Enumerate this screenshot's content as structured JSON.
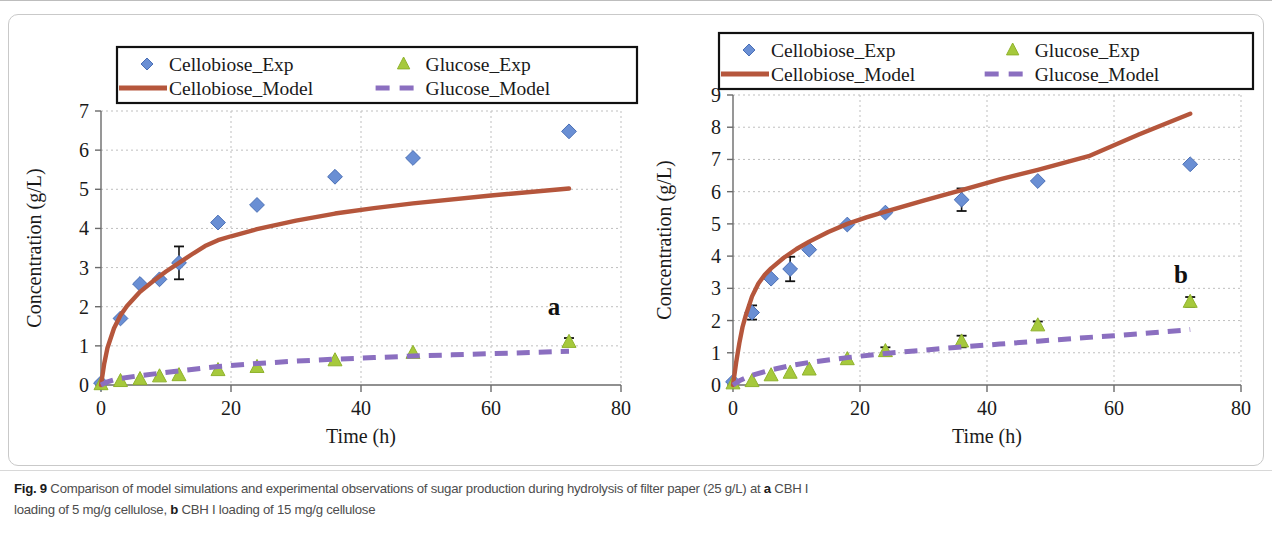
{
  "figure": {
    "number": "Fig. 9",
    "caption_line1_pre": "Comparison of model simulations and experimental observations of sugar production during hydrolysis of filter paper (25 g/L) at ",
    "caption_bold_a": "a",
    "caption_line1_post": " CBH I",
    "caption_line2_pre": "loading of 5 mg/g cellulose, ",
    "caption_bold_b": "b",
    "caption_line2_post": " CBH I loading of 15 mg/g cellulose"
  },
  "colors": {
    "cellobiose_exp": "#6a8fd4",
    "cellobiose_exp_edge": "#4a6fb5",
    "glucose_exp": "#a6c93c",
    "glucose_exp_edge": "#8fb22c",
    "cellobiose_model": "#b5563c",
    "glucose_model": "#8b6fc0",
    "grid": "#bfbfbf",
    "axis": "#6b6b6b",
    "error_bar": "#111111"
  },
  "legend": {
    "items": [
      {
        "label": "Cellobiose_Exp",
        "marker": "diamond-marker",
        "color_key": "cellobiose_exp"
      },
      {
        "label": "Glucose_Exp",
        "marker": "triangle-marker",
        "color_key": "glucose_exp"
      },
      {
        "label": "Cellobiose_Model",
        "marker": "solid-line",
        "color_key": "cellobiose_model"
      },
      {
        "label": "Glucose_Model",
        "marker": "dashed-line",
        "color_key": "glucose_model"
      }
    ]
  },
  "chart_data": [
    {
      "id": "panel-a",
      "type": "scatter",
      "panel_letter": "a",
      "title": "",
      "xlabel": "Time (h)",
      "ylabel": "Concentration (g/L)",
      "xlim": [
        0,
        80
      ],
      "ylim": [
        0,
        7
      ],
      "xticks": [
        0,
        20,
        40,
        60,
        80
      ],
      "yticks": [
        0,
        1,
        2,
        3,
        4,
        5,
        6,
        7
      ],
      "grid": true,
      "legend_position": "top-inside",
      "series": [
        {
          "name": "Cellobiose_Exp",
          "kind": "scatter",
          "marker": "diamond",
          "x": [
            0,
            3,
            6,
            9,
            12,
            18,
            24,
            36,
            48,
            72
          ],
          "y": [
            0.05,
            1.7,
            2.58,
            2.7,
            3.12,
            4.15,
            4.6,
            5.32,
            5.8,
            6.48
          ],
          "yerr": [
            0,
            0,
            0,
            0,
            0.42,
            0,
            0,
            0,
            0,
            0
          ]
        },
        {
          "name": "Glucose_Exp",
          "kind": "scatter",
          "marker": "triangle",
          "x": [
            0,
            3,
            6,
            9,
            12,
            18,
            24,
            36,
            48,
            72
          ],
          "y": [
            0.02,
            0.1,
            0.15,
            0.22,
            0.25,
            0.38,
            0.46,
            0.63,
            0.82,
            1.1
          ],
          "yerr": [
            0,
            0,
            0,
            0,
            0,
            0,
            0,
            0,
            0,
            0.1
          ]
        },
        {
          "name": "Cellobiose_Model",
          "kind": "line",
          "style": "solid",
          "x": [
            0,
            0.5,
            1,
            2,
            3,
            4,
            6,
            8,
            10,
            12,
            14,
            16,
            18,
            20,
            24,
            30,
            36,
            42,
            48,
            60,
            72
          ],
          "y": [
            0.0,
            0.55,
            0.95,
            1.45,
            1.78,
            2.02,
            2.38,
            2.65,
            2.9,
            3.12,
            3.34,
            3.55,
            3.7,
            3.8,
            3.98,
            4.2,
            4.38,
            4.52,
            4.64,
            4.84,
            5.02
          ]
        },
        {
          "name": "Glucose_Model",
          "kind": "line",
          "style": "dashed",
          "x": [
            0,
            1,
            2,
            3,
            6,
            9,
            12,
            18,
            24,
            30,
            36,
            42,
            48,
            54,
            60,
            66,
            72
          ],
          "y": [
            0.0,
            0.08,
            0.13,
            0.17,
            0.24,
            0.3,
            0.36,
            0.47,
            0.55,
            0.61,
            0.66,
            0.7,
            0.74,
            0.77,
            0.8,
            0.83,
            0.86
          ]
        }
      ]
    },
    {
      "id": "panel-b",
      "type": "scatter",
      "panel_letter": "b",
      "title": "",
      "xlabel": "Time (h)",
      "ylabel": "Concentration (g/L)",
      "xlim": [
        0,
        80
      ],
      "ylim": [
        0,
        9
      ],
      "xticks": [
        0,
        20,
        40,
        60,
        80
      ],
      "yticks": [
        0,
        1,
        2,
        3,
        4,
        5,
        6,
        7,
        8,
        9
      ],
      "grid": true,
      "legend_position": "top-inside",
      "series": [
        {
          "name": "Cellobiose_Exp",
          "kind": "scatter",
          "marker": "diamond",
          "x": [
            0,
            3,
            6,
            9,
            12,
            18,
            24,
            36,
            48,
            72
          ],
          "y": [
            0.1,
            2.25,
            3.3,
            3.6,
            4.2,
            4.98,
            5.35,
            5.75,
            6.33,
            6.85
          ],
          "yerr": [
            0,
            0.22,
            0,
            0.38,
            0,
            0,
            0,
            0.35,
            0,
            0
          ]
        },
        {
          "name": "Glucose_Exp",
          "kind": "scatter",
          "marker": "triangle",
          "x": [
            0,
            3,
            6,
            9,
            12,
            18,
            24,
            36,
            48,
            72
          ],
          "y": [
            0.05,
            0.12,
            0.3,
            0.38,
            0.48,
            0.8,
            1.05,
            1.35,
            1.85,
            2.58
          ],
          "yerr": [
            0,
            0,
            0,
            0,
            0,
            0,
            0.12,
            0.18,
            0.12,
            0.15
          ]
        },
        {
          "name": "Cellobiose_Model",
          "kind": "line",
          "style": "solid",
          "x": [
            0,
            0.5,
            1,
            1.5,
            2,
            3,
            4,
            5,
            6,
            8,
            10,
            12,
            15,
            18,
            21,
            24,
            30,
            36,
            42,
            48,
            56,
            64,
            72
          ],
          "y": [
            0.0,
            0.7,
            1.3,
            1.8,
            2.15,
            2.75,
            3.15,
            3.42,
            3.62,
            3.95,
            4.22,
            4.45,
            4.75,
            5.0,
            5.2,
            5.38,
            5.72,
            6.05,
            6.38,
            6.68,
            7.1,
            7.78,
            8.42
          ]
        },
        {
          "name": "Glucose_Model",
          "kind": "line",
          "style": "dashed",
          "x": [
            0,
            1,
            2,
            3,
            6,
            9,
            12,
            18,
            24,
            30,
            36,
            42,
            48,
            54,
            60,
            66,
            72
          ],
          "y": [
            0.0,
            0.13,
            0.22,
            0.3,
            0.47,
            0.6,
            0.7,
            0.85,
            0.98,
            1.08,
            1.18,
            1.27,
            1.36,
            1.45,
            1.53,
            1.62,
            1.72
          ]
        }
      ]
    }
  ]
}
